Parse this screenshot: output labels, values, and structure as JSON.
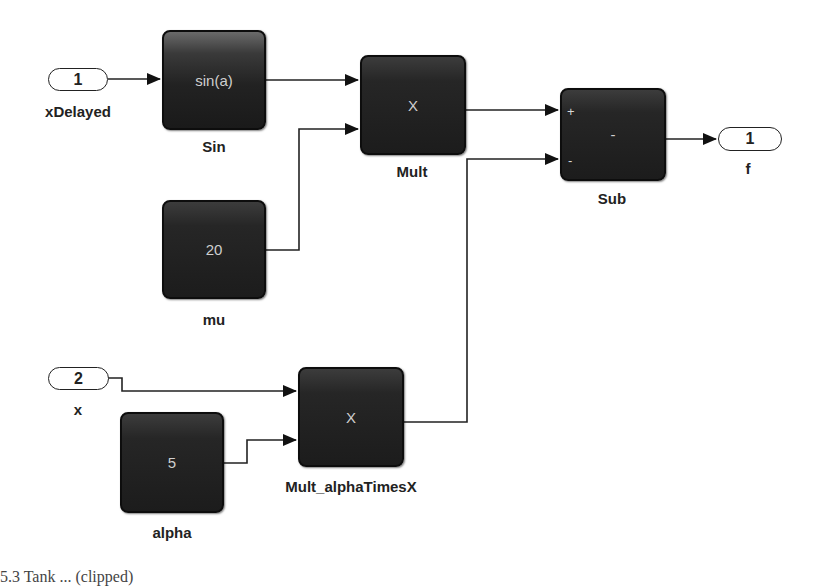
{
  "diagram": {
    "type": "simulink-block-diagram",
    "inports": [
      {
        "id": "in1",
        "number": "1",
        "name": "xDelayed"
      },
      {
        "id": "in2",
        "number": "2",
        "name": "x"
      }
    ],
    "outports": [
      {
        "id": "out1",
        "number": "1",
        "name": "f"
      }
    ],
    "blocks": [
      {
        "id": "sin",
        "name": "Sin",
        "glyph": "sin(a)"
      },
      {
        "id": "mult",
        "name": "Mult",
        "glyph": "X"
      },
      {
        "id": "sub",
        "name": "Sub",
        "glyph": "-",
        "port_signs": [
          "+",
          "-"
        ]
      },
      {
        "id": "mu",
        "name": "mu",
        "glyph": "20"
      },
      {
        "id": "alpha",
        "name": "alpha",
        "glyph": "5"
      },
      {
        "id": "mult_alpha",
        "name": "Mult_alphaTimesX",
        "glyph": "X"
      }
    ],
    "connections": [
      {
        "from": "xDelayed",
        "to": "Sin"
      },
      {
        "from": "Sin",
        "to": "Mult.in1"
      },
      {
        "from": "mu",
        "to": "Mult.in2"
      },
      {
        "from": "Mult",
        "to": "Sub.in1(+)"
      },
      {
        "from": "Mult_alphaTimesX",
        "to": "Sub.in2(-)"
      },
      {
        "from": "Sub",
        "to": "f"
      },
      {
        "from": "x",
        "to": "Mult_alphaTimesX.in1"
      },
      {
        "from": "alpha",
        "to": "Mult_alphaTimesX.in2"
      }
    ],
    "caption": "5.3  Tank ... (clipped)"
  }
}
